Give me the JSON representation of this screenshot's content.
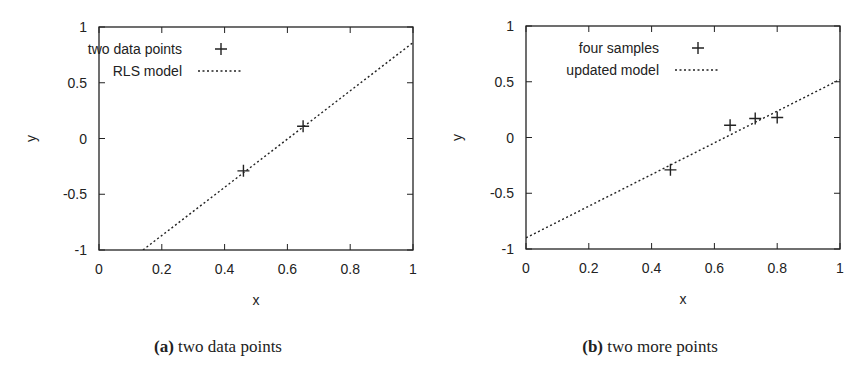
{
  "chart_data": [
    {
      "type": "scatter",
      "panel": "a",
      "caption_tag": "(a)",
      "caption": "two data points",
      "xlabel": "x",
      "ylabel": "y",
      "xlim": [
        0,
        1
      ],
      "ylim": [
        -1,
        1
      ],
      "xticks": [
        "0",
        "0.2",
        "0.4",
        "0.6",
        "0.8",
        "1"
      ],
      "yticks": [
        "1",
        "0.5",
        "0",
        "-0.5",
        "-1"
      ],
      "grid": false,
      "legend_position": "top-center",
      "series": [
        {
          "name": "two data points",
          "style": "plus-marker",
          "points": [
            [
              0.46,
              -0.29
            ],
            [
              0.65,
              0.11
            ]
          ]
        },
        {
          "name": "RLS model",
          "style": "dotted-line",
          "points": [
            [
              0.14,
              -1.0
            ],
            [
              1.0,
              0.86
            ]
          ]
        }
      ]
    },
    {
      "type": "scatter",
      "panel": "b",
      "caption_tag": "(b)",
      "caption": "two more points",
      "xlabel": "x",
      "ylabel": "y",
      "xlim": [
        0,
        1
      ],
      "ylim": [
        -1,
        1
      ],
      "xticks": [
        "0",
        "0.2",
        "0.4",
        "0.6",
        "0.8",
        "1"
      ],
      "yticks": [
        "1",
        "0.5",
        "0",
        "-0.5",
        "-1"
      ],
      "grid": false,
      "legend_position": "top-left",
      "series": [
        {
          "name": "four samples",
          "style": "plus-marker",
          "points": [
            [
              0.46,
              -0.29
            ],
            [
              0.65,
              0.11
            ],
            [
              0.73,
              0.17
            ],
            [
              0.8,
              0.18
            ]
          ]
        },
        {
          "name": "updated model",
          "style": "dotted-line",
          "points": [
            [
              0.0,
              -0.9
            ],
            [
              1.0,
              0.52
            ]
          ]
        }
      ]
    }
  ],
  "colors": {
    "ink": "#222222",
    "background": "#ffffff"
  }
}
